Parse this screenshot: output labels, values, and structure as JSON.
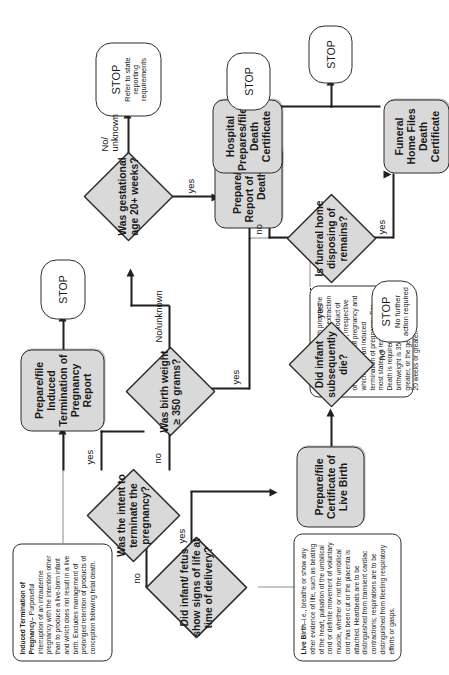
{
  "diagram": {
    "notes": {
      "live_birth": {
        "term": "Live Birth",
        "text": "–i.e., breathe or show any other evidence of life, such as beating of the heart, pulsation of the umbilical cord or definite movement of voluntary muscle, whether or not the umbilical cord has been cut or the placenta is attached. Heartbeats are to be distinguished from transient cardiac contractions; respirations are to be distinguished from fleeting respiratory efforts or gasps."
      },
      "fetal_death": {
        "term": "Fetal Death",
        "text": " – Death prior to the complete expulsion or extraction from its mother of a product of human conception, irrespective of the duration of pregnancy and which is not an induced termination of pregnancy. For most states, a report of Fetal Death is required when the birthweight is 350 grams or greater, or the gestational age is 20 weeks or greater."
      },
      "induced_termination": {
        "term": "Induced Termination of Pregnancy–",
        "text": "Purposeful interruption of an intrauterine pregnancy with the intention other than to produce a live-born infant and which does not result in a live birth. Excludes management of prolonged retention of products of conception following fetal death."
      }
    },
    "decisions": {
      "signs_of_life": "Did infant/ fetus show signs of life at time of delivery?",
      "intent_terminate": "Was the intent to terminate the pregnancy?",
      "birth_weight": "Was birth weight ≥ 350 grams?",
      "gestational_age": "Was gestational age 20+ weeks?",
      "infant_died": "Did infant subsequently die?",
      "funeral_home": "Is funeral home disposing of remains?"
    },
    "processes": {
      "itop_report": "Prepare/file Induced Termination of Pregnancy Report",
      "fetal_death_report": "Prepare/file Report of Fetal Death",
      "live_birth_certificate": "Prepare/file Certificate of Live Birth",
      "hospital_death_certificate": "Hospital Prepares/files Death Certificate",
      "funeral_home_death_certificate": "Funeral Home Files Death Certificate"
    },
    "terminators": {
      "stop_itop": "STOP",
      "stop_state": {
        "main": "STOP",
        "sub": "Refer to state reporting requirements"
      },
      "stop_fetal_death": "STOP",
      "stop_no_action": {
        "main": "STOP",
        "sub": "No further action required"
      },
      "stop_death_certificate": "STOP"
    },
    "edge_labels": {
      "signs_yes": "yes",
      "signs_no": "no",
      "intent_yes": "yes",
      "intent_no": "no",
      "weight_yes": "yes",
      "weight_no": "No/unknown",
      "gestation_yes": "yes",
      "gestation_no": "No/ unknown",
      "died_yes": "yes",
      "died_no": "no",
      "funeral_yes": "yes",
      "funeral_no": "no"
    },
    "colors": {
      "process_fill": "#d9d9d9",
      "decision_fill": "#d9d9d9",
      "terminator_fill": "#ffffff",
      "stroke": "#2b2b2b"
    }
  }
}
